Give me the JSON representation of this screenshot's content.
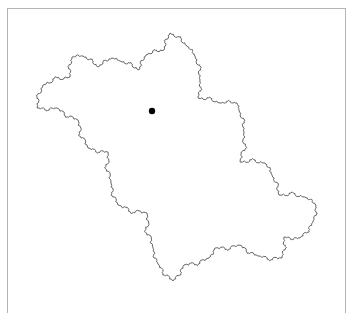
{
  "figure": {
    "frame_color": "#b4b4b4",
    "outline_color": "#555555",
    "outline_width": 0.9,
    "marker": {
      "x": 152,
      "y": 111,
      "r": 3.2,
      "color": "#000000"
    },
    "outline_vertices": [
      [
        37,
        108
      ],
      [
        43,
        85
      ],
      [
        70,
        77
      ],
      [
        72,
        57
      ],
      [
        83,
        56
      ],
      [
        98,
        67
      ],
      [
        112,
        58
      ],
      [
        120,
        61
      ],
      [
        139,
        70
      ],
      [
        146,
        55
      ],
      [
        164,
        50
      ],
      [
        170,
        33
      ],
      [
        187,
        46
      ],
      [
        195,
        56
      ],
      [
        200,
        80
      ],
      [
        198,
        98
      ],
      [
        220,
        103
      ],
      [
        237,
        103
      ],
      [
        239,
        110
      ],
      [
        244,
        132
      ],
      [
        240,
        162
      ],
      [
        265,
        163
      ],
      [
        272,
        175
      ],
      [
        279,
        195
      ],
      [
        305,
        197
      ],
      [
        316,
        205
      ],
      [
        313,
        222
      ],
      [
        300,
        238
      ],
      [
        284,
        237
      ],
      [
        282,
        258
      ],
      [
        258,
        256
      ],
      [
        240,
        245
      ],
      [
        215,
        248
      ],
      [
        209,
        258
      ],
      [
        184,
        265
      ],
      [
        173,
        281
      ],
      [
        158,
        264
      ],
      [
        153,
        248
      ],
      [
        147,
        213
      ],
      [
        118,
        205
      ],
      [
        111,
        183
      ],
      [
        108,
        152
      ],
      [
        88,
        148
      ],
      [
        78,
        120
      ],
      [
        57,
        108
      ],
      [
        37,
        108
      ]
    ],
    "fractal_depth": 2
  }
}
